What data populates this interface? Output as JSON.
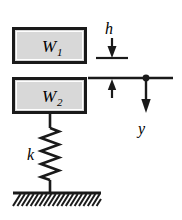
{
  "figure": {
    "background_color": "#ffffff",
    "stroke_color": "#1a1a1a",
    "block_fill_color": "#d8d8d8"
  },
  "blocks": [
    {
      "name": "upper-mass",
      "label": "W",
      "subscript": "1",
      "x": 13,
      "y": 28,
      "width": 72,
      "height": 34
    },
    {
      "name": "lower-mass",
      "label": "W",
      "subscript": "2",
      "x": 13,
      "y": 78,
      "width": 72,
      "height": 34
    }
  ],
  "spring": {
    "name": "coil-spring",
    "label": "k",
    "label_x": 27,
    "label_y": 160,
    "center_x": 50,
    "top_y": 112,
    "coil_start_y": 128,
    "coil_end_y": 180,
    "bottom_y": 193,
    "amplitude": 9,
    "cycles": 8
  },
  "ground": {
    "name": "fixed-ground",
    "line_y": 193,
    "x_start": 13,
    "x_end": 101,
    "hatch_count": 20,
    "hatch_length": 13
  },
  "dimensions": [
    {
      "name": "drop-height-h",
      "label": "h",
      "label_x": 110,
      "label_y": 28,
      "arrow_x": 112,
      "arrow_top_y": 36,
      "arrow_bottom_y": 57,
      "ref_line_y": 58,
      "ref_line_x1": 96,
      "ref_line_x2": 128,
      "direction": "down"
    },
    {
      "name": "contact-datum-tick",
      "label": "",
      "arrow_x": 112,
      "arrow_top_y": 78,
      "arrow_bottom_y": 98,
      "direction": "up"
    },
    {
      "name": "displacement-y",
      "label": "y",
      "label_x": 142,
      "label_y": 128,
      "arrow_x": 146,
      "arrow_top_y": 78,
      "arrow_bottom_y": 112,
      "dot_radius": 3,
      "direction": "down"
    }
  ],
  "datum_line": {
    "name": "datum-reference-line",
    "y": 78,
    "x1": 88,
    "x2": 173
  }
}
